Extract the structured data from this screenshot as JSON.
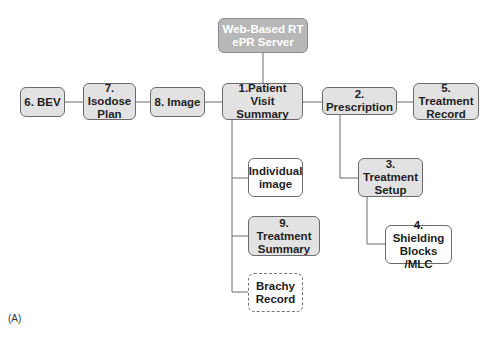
{
  "diagram": {
    "caption": "(A)",
    "nodes": {
      "server": "Web-Based RT\nePR Server",
      "bev": "6. BEV",
      "isodose": "7. Isodose\nPlan",
      "image": "8. Image",
      "patient_visit": "1.Patient Visit\nSummary",
      "prescription": "2. Prescription",
      "treatment_record": "5. Treatment\nRecord",
      "individual_image": "Individual\nimage",
      "treatment_summary": "9. Treatment\nSummary",
      "brachy": "Brachy\nRecord",
      "treatment_setup": "3. Treatment\nSetup",
      "shielding": "4. Shielding\nBlocks /MLC"
    },
    "colors": {
      "node_fill": "#e2e2e2",
      "server_fill": "#b7b7b7",
      "line": "#6b6b6b"
    }
  }
}
